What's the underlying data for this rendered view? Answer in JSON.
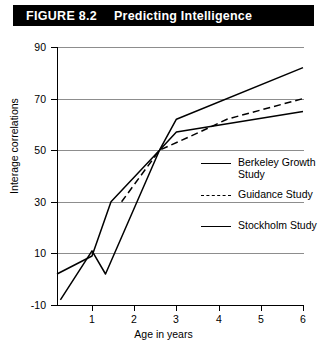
{
  "figure": {
    "number": "FIGURE 8.2",
    "title": "Predicting Intelligence"
  },
  "chart_data": {
    "type": "line",
    "title": "Predicting Intelligence",
    "xlabel": "Age in years",
    "ylabel": "Interage correlations",
    "xlim": [
      0.17,
      6
    ],
    "ylim": [
      -10,
      90
    ],
    "xticks": [
      1,
      2,
      3,
      4,
      5,
      6
    ],
    "yticks": [
      -10,
      10,
      30,
      50,
      70,
      90
    ],
    "xtick_labels": [
      "1",
      "2",
      "3",
      "4",
      "5",
      "6"
    ],
    "ytick_labels": [
      "-10",
      "10",
      "30",
      "50",
      "70",
      "90"
    ],
    "grid": true,
    "grid_axis": "y",
    "legend_position": "center-right",
    "series": [
      {
        "name": "Berkeley Growth Study",
        "style": "solid",
        "color": "#000000",
        "points": [
          {
            "x": 0.17,
            "y": 2
          },
          {
            "x": 1.0,
            "y": 9
          },
          {
            "x": 1.45,
            "y": 30
          },
          {
            "x": 2.6,
            "y": 50
          },
          {
            "x": 3.0,
            "y": 62
          },
          {
            "x": 6.0,
            "y": 82
          }
        ]
      },
      {
        "name": "Guidance Study",
        "style": "dashed",
        "color": "#000000",
        "points": [
          {
            "x": 1.7,
            "y": 30
          },
          {
            "x": 2.6,
            "y": 50
          },
          {
            "x": 3.55,
            "y": 57
          },
          {
            "x": 4.2,
            "y": 62
          },
          {
            "x": 6.0,
            "y": 70
          }
        ]
      },
      {
        "name": "Stockholm Study",
        "style": "solid",
        "color": "#000000",
        "points": [
          {
            "x": 0.25,
            "y": -8
          },
          {
            "x": 1.0,
            "y": 11
          },
          {
            "x": 1.32,
            "y": 2
          },
          {
            "x": 2.6,
            "y": 50
          },
          {
            "x": 3.0,
            "y": 57
          },
          {
            "x": 6.0,
            "y": 65
          }
        ]
      }
    ]
  },
  "legend": {
    "items": [
      {
        "label": "Berkeley Growth Study",
        "style": "solid"
      },
      {
        "label": "Guidance Study",
        "style": "dashed"
      },
      {
        "label": "Stockholm Study",
        "style": "solid"
      }
    ]
  }
}
